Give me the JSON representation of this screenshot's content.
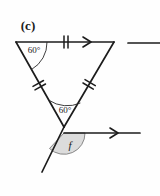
{
  "figure": {
    "part_label": "(c)",
    "background_color": "#fefefe",
    "line_color": "#1c1c1c",
    "sector_fill_color": "#dcdcdc",
    "sector_stroke_color": "#6e6e6e"
  },
  "angles": {
    "top_left_vertex": "60°",
    "apex_interior": "60°",
    "unknown_shaded": "f"
  },
  "marks": {
    "top_side_ticks": "double-tick",
    "left_leg_ticks": "double-tick",
    "right_leg_ticks": "double-tick",
    "top_side_arrow": "single-arrow",
    "lower_ray_arrow": "single-arrow"
  },
  "geometry": {
    "triangle_top_left": "16,42",
    "triangle_top_right": "114,42",
    "triangle_apex": "64,127",
    "right_segment_start": "128,43",
    "right_segment_end": "160,43",
    "lower_ray_start": "64,133",
    "lower_ray_end": "140,133",
    "transversal_end": "42,172"
  }
}
